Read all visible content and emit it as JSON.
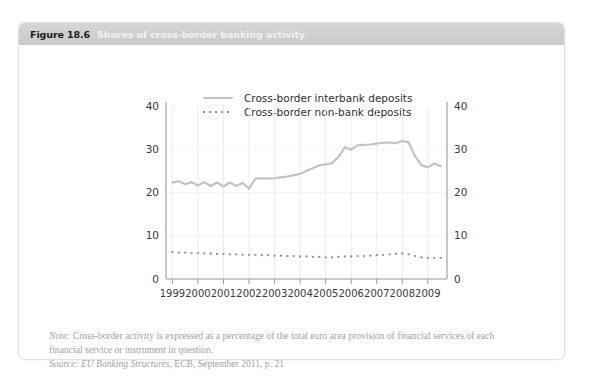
{
  "figure": {
    "number": "Figure 18.6",
    "title": "Shares of cross-border banking activity"
  },
  "legend": {
    "items": [
      {
        "label": "Cross-border interbank deposits",
        "style": "solid",
        "color": "#c2c2c2"
      },
      {
        "label": "Cross-border non-bank deposits",
        "style": "dotted",
        "color": "#8f8f8f"
      }
    ]
  },
  "notes": {
    "note_prefix": "Note:",
    "note_line1": " Cross-border activity is expressed as a percentage of the total euro area provision of financial services of each",
    "note_line2": "financial service or instrument in question.",
    "source_prefix": "Source:",
    "source_italic": " EU Banking Structures",
    "source_rest": ", ECB, September 2011, p. 21"
  },
  "chart_data": {
    "type": "line",
    "title": "Shares of cross-border banking activity",
    "xlabel": "",
    "ylabel": "",
    "ylim": [
      0,
      40
    ],
    "yticks": [
      0,
      10,
      20,
      30,
      40
    ],
    "left_axis_labels": [
      "0",
      "10",
      "20",
      "30",
      "40"
    ],
    "right_axis_labels": [
      "0",
      "10",
      "20",
      "30",
      "40"
    ],
    "xticks": [
      1999,
      2000,
      2001,
      2002,
      2003,
      2004,
      2005,
      2006,
      2007,
      2008,
      2009
    ],
    "xtick_labels": [
      "1999",
      "2000",
      "2001",
      "2002",
      "2003",
      "2004",
      "2005",
      "2006",
      "2007",
      "2008",
      "2009"
    ],
    "xlim": [
      1998.75,
      2009.75
    ],
    "grid": "vertical-at-years plus faint horizontal",
    "legend_position": "top-center",
    "series": [
      {
        "name": "Cross-border interbank deposits",
        "style": "solid",
        "color": "#c2c2c2",
        "x": [
          1999.0,
          1999.25,
          1999.5,
          1999.75,
          2000.0,
          2000.25,
          2000.5,
          2000.75,
          2001.0,
          2001.25,
          2001.5,
          2001.75,
          2002.0,
          2002.25,
          2002.5,
          2002.75,
          2003.0,
          2003.25,
          2003.5,
          2003.75,
          2004.0,
          2004.25,
          2004.5,
          2004.75,
          2005.0,
          2005.25,
          2005.5,
          2005.75,
          2006.0,
          2006.25,
          2006.5,
          2006.75,
          2007.0,
          2007.25,
          2007.5,
          2007.75,
          2008.0,
          2008.25,
          2008.5,
          2008.75,
          2009.0,
          2009.25,
          2009.5
        ],
        "values": [
          22.3,
          22.6,
          21.9,
          22.4,
          21.6,
          22.4,
          21.5,
          22.3,
          21.4,
          22.3,
          21.5,
          22.2,
          20.9,
          23.2,
          23.3,
          23.2,
          23.3,
          23.5,
          23.7,
          24.0,
          24.3,
          25.0,
          25.6,
          26.3,
          26.5,
          26.8,
          28.2,
          30.5,
          29.9,
          30.9,
          31.0,
          31.1,
          31.3,
          31.5,
          31.6,
          31.4,
          31.9,
          31.6,
          28.4,
          26.3,
          25.8,
          26.7,
          26.1
        ]
      },
      {
        "name": "Cross-border non-bank deposits",
        "style": "dotted",
        "color": "#8f8f8f",
        "x": [
          1999.0,
          1999.25,
          1999.5,
          1999.75,
          2000.0,
          2000.25,
          2000.5,
          2000.75,
          2001.0,
          2001.25,
          2001.5,
          2001.75,
          2002.0,
          2002.25,
          2002.5,
          2002.75,
          2003.0,
          2003.25,
          2003.5,
          2003.75,
          2004.0,
          2004.25,
          2004.5,
          2004.75,
          2005.0,
          2005.25,
          2005.5,
          2005.75,
          2006.0,
          2006.25,
          2006.5,
          2006.75,
          2007.0,
          2007.25,
          2007.5,
          2007.75,
          2008.0,
          2008.25,
          2008.5,
          2008.75,
          2009.0,
          2009.25,
          2009.5
        ],
        "values": [
          6.2,
          6.1,
          6.1,
          6.0,
          6.0,
          5.9,
          5.9,
          5.8,
          5.8,
          5.7,
          5.7,
          5.6,
          5.6,
          5.6,
          5.5,
          5.5,
          5.4,
          5.4,
          5.3,
          5.3,
          5.2,
          5.2,
          5.1,
          5.1,
          5.0,
          5.0,
          5.1,
          5.2,
          5.2,
          5.3,
          5.3,
          5.4,
          5.5,
          5.6,
          5.7,
          5.8,
          5.9,
          5.7,
          5.3,
          5.0,
          4.9,
          4.9,
          4.9
        ]
      }
    ]
  }
}
